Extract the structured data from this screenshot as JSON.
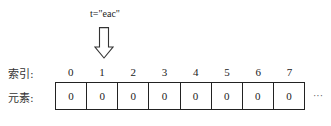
{
  "pointer": {
    "label": "t=\"eac\"",
    "target_index": 1,
    "icon": "down-arrow-icon"
  },
  "labels": {
    "index_row": "索引:",
    "element_row": "元素:"
  },
  "indices": [
    "0",
    "1",
    "2",
    "3",
    "4",
    "5",
    "6",
    "7"
  ],
  "elements": [
    "0",
    "0",
    "0",
    "0",
    "0",
    "0",
    "0",
    "0"
  ],
  "ellipsis": "···"
}
